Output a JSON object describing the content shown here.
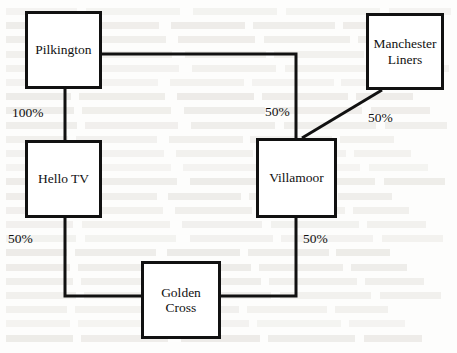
{
  "figure": {
    "type": "organisation-ownership-diagram"
  },
  "nodes": [
    {
      "id": "pilkington",
      "label": "Pilkington",
      "x": 25,
      "y": 11,
      "w": 77,
      "h": 78
    },
    {
      "id": "manchester_liners",
      "label": "Manchester\nLiners",
      "x": 366,
      "y": 13,
      "w": 78,
      "h": 77
    },
    {
      "id": "hello_tv",
      "label": "Hello TV",
      "x": 25,
      "y": 140,
      "w": 77,
      "h": 78
    },
    {
      "id": "villamoor",
      "label": "Villamoor",
      "x": 256,
      "y": 138,
      "w": 81,
      "h": 80
    },
    {
      "id": "golden_cross",
      "label": "Golden\nCross",
      "x": 141,
      "y": 261,
      "w": 80,
      "h": 78
    }
  ],
  "edges": [
    {
      "id": "pilkington-hello_tv",
      "label": "100%",
      "label_x": 12,
      "label_y": 105
    },
    {
      "id": "pilkington-villamoor",
      "label": "50%",
      "label_x": 265,
      "label_y": 104
    },
    {
      "id": "manchester_liners-villamoor",
      "label": "50%",
      "label_x": 368,
      "label_y": 110
    },
    {
      "id": "hello_tv-golden_cross",
      "label": "50%",
      "label_x": 8,
      "label_y": 231
    },
    {
      "id": "villamoor-golden_cross",
      "label": "50%",
      "label_x": 303,
      "label_y": 231
    }
  ],
  "colors": {
    "stroke": "#111111",
    "background": "#ffffff",
    "text": "#111111"
  }
}
